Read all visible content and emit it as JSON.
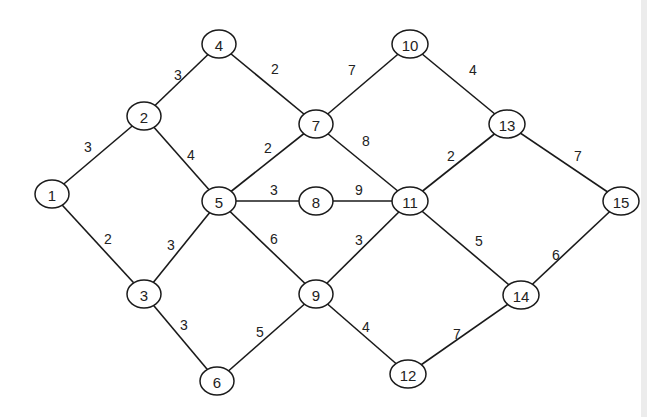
{
  "diagram": {
    "type": "weighted-undirected-graph",
    "colors": {
      "stroke": "#1a1a1a",
      "text": "#222222",
      "background": "#ffffff"
    },
    "nodes": [
      {
        "id": "1",
        "label": "1",
        "x": 52,
        "y": 194
      },
      {
        "id": "2",
        "label": "2",
        "x": 144,
        "y": 116
      },
      {
        "id": "3",
        "label": "3",
        "x": 144,
        "y": 294
      },
      {
        "id": "4",
        "label": "4",
        "x": 219,
        "y": 44
      },
      {
        "id": "5",
        "label": "5",
        "x": 219,
        "y": 201
      },
      {
        "id": "6",
        "label": "6",
        "x": 217,
        "y": 381
      },
      {
        "id": "7",
        "label": "7",
        "x": 316,
        "y": 124
      },
      {
        "id": "8",
        "label": "8",
        "x": 316,
        "y": 201
      },
      {
        "id": "9",
        "label": "9",
        "x": 316,
        "y": 294
      },
      {
        "id": "10",
        "label": "10",
        "x": 410,
        "y": 44
      },
      {
        "id": "11",
        "label": "11",
        "x": 410,
        "y": 201
      },
      {
        "id": "12",
        "label": "12",
        "x": 408,
        "y": 374
      },
      {
        "id": "13",
        "label": "13",
        "x": 507,
        "y": 124
      },
      {
        "id": "14",
        "label": "14",
        "x": 521,
        "y": 295
      },
      {
        "id": "15",
        "label": "15",
        "x": 621,
        "y": 201
      }
    ],
    "edges": [
      {
        "from": "1",
        "to": "2",
        "weight": "3",
        "lx": 88,
        "ly": 147
      },
      {
        "from": "1",
        "to": "3",
        "weight": "2",
        "lx": 108,
        "ly": 239
      },
      {
        "from": "2",
        "to": "4",
        "weight": "3",
        "lx": 178,
        "ly": 75
      },
      {
        "from": "2",
        "to": "5",
        "weight": "4",
        "lx": 191,
        "ly": 155
      },
      {
        "from": "3",
        "to": "5",
        "weight": "3",
        "lx": 171,
        "ly": 245
      },
      {
        "from": "3",
        "to": "6",
        "weight": "3",
        "lx": 184,
        "ly": 325
      },
      {
        "from": "4",
        "to": "7",
        "weight": "2",
        "lx": 275,
        "ly": 69
      },
      {
        "from": "5",
        "to": "7",
        "weight": "2",
        "lx": 268,
        "ly": 148
      },
      {
        "from": "5",
        "to": "8",
        "weight": "3",
        "lx": 274,
        "ly": 190
      },
      {
        "from": "5",
        "to": "9",
        "weight": "6",
        "lx": 274,
        "ly": 239
      },
      {
        "from": "6",
        "to": "9",
        "weight": "5",
        "lx": 260,
        "ly": 332
      },
      {
        "from": "7",
        "to": "10",
        "weight": "7",
        "lx": 352,
        "ly": 70
      },
      {
        "from": "7",
        "to": "11",
        "weight": "8",
        "lx": 366,
        "ly": 141
      },
      {
        "from": "8",
        "to": "11",
        "weight": "9",
        "lx": 359,
        "ly": 190
      },
      {
        "from": "9",
        "to": "11",
        "weight": "3",
        "lx": 359,
        "ly": 240
      },
      {
        "from": "9",
        "to": "12",
        "weight": "4",
        "lx": 366,
        "ly": 327
      },
      {
        "from": "10",
        "to": "13",
        "weight": "4",
        "lx": 473,
        "ly": 70
      },
      {
        "from": "11",
        "to": "13",
        "weight": "2",
        "lx": 451,
        "ly": 156
      },
      {
        "from": "11",
        "to": "14",
        "weight": "5",
        "lx": 479,
        "ly": 241
      },
      {
        "from": "12",
        "to": "14",
        "weight": "7",
        "lx": 457,
        "ly": 334
      },
      {
        "from": "13",
        "to": "15",
        "weight": "7",
        "lx": 578,
        "ly": 156
      },
      {
        "from": "14",
        "to": "15",
        "weight": "6",
        "lx": 556,
        "ly": 255
      }
    ]
  }
}
